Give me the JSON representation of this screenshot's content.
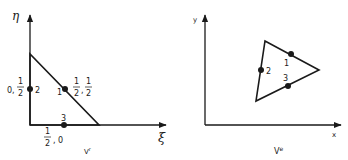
{
  "reference_element": {
    "axes": {
      "vertical_label": "η",
      "horizontal_label": "ξ"
    },
    "caption": {
      "base": "V",
      "sup": "r"
    },
    "nodes": [
      {
        "id": "1",
        "coord_label": {
          "a_num": "1",
          "a_den": "2",
          "b_num": "1",
          "b_den": "2"
        }
      },
      {
        "id": "2",
        "coord_label": {
          "a": "0",
          "b_num": "1",
          "b_den": "2"
        }
      },
      {
        "id": "3",
        "coord_label": {
          "a_num": "1",
          "a_den": "2",
          "b": "0"
        }
      }
    ]
  },
  "physical_element": {
    "axes": {
      "vertical_label": "y",
      "horizontal_label": "x"
    },
    "caption": {
      "base": "V",
      "sup": "e"
    },
    "nodes": [
      {
        "id": "1"
      },
      {
        "id": "2"
      },
      {
        "id": "3"
      }
    ]
  },
  "colors": {
    "ink": "#1a1a1a",
    "background": "#ffffff"
  }
}
